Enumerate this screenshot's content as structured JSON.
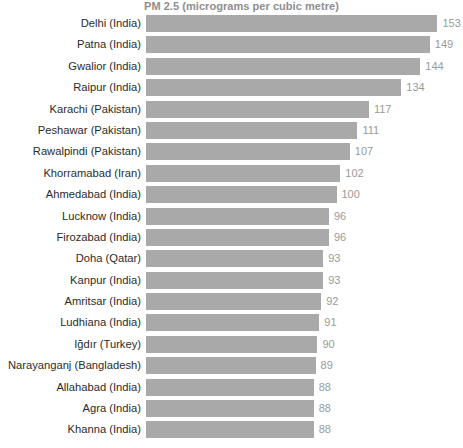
{
  "chart_data": {
    "type": "bar",
    "orientation": "horizontal",
    "title": "PM 2.5 (micrograms per cubic metre)",
    "xlabel": "",
    "ylabel": "",
    "grid": false,
    "legend": null,
    "xlim": [
      0,
      153
    ],
    "value_labels_shown": true,
    "bar_color": "#a9a9a9",
    "label_color": "#2b2b2b",
    "value_color": "#9a9a9a",
    "title_color": "#8e8e8e",
    "background_color": "#ffffff",
    "categories": [
      "Delhi (India)",
      "Patna (India)",
      "Gwalior (India)",
      "Raipur (India)",
      "Karachi (Pakistan)",
      "Peshawar (Pakistan)",
      "Rawalpindi (Pakistan)",
      "Khorramabad (Iran)",
      "Ahmedabad (India)",
      "Lucknow (India)",
      "Firozabad (India)",
      "Doha (Qatar)",
      "Kanpur (India)",
      "Amritsar (India)",
      "Ludhiana (India)",
      "Iğdır (Turkey)",
      "Narayanganj (Bangladesh)",
      "Allahabad (India)",
      "Agra (India)",
      "Khanna (India)"
    ],
    "values": [
      153,
      149,
      144,
      134,
      117,
      111,
      107,
      102,
      100,
      96,
      96,
      93,
      93,
      92,
      91,
      90,
      89,
      88,
      88,
      88
    ]
  }
}
